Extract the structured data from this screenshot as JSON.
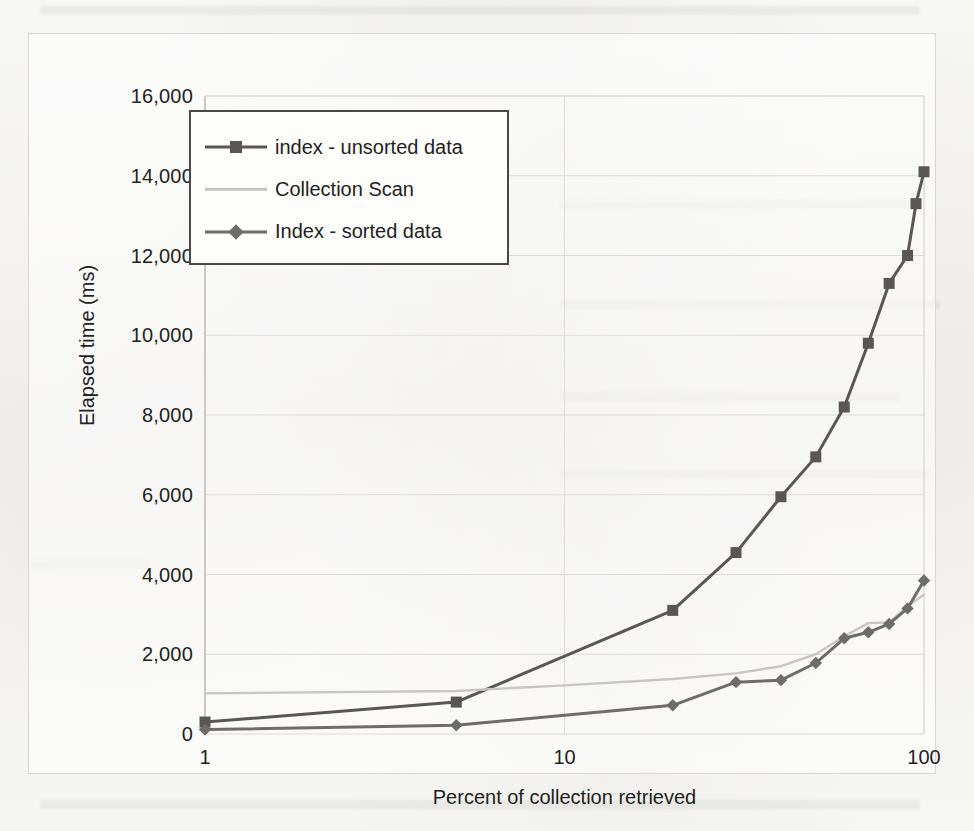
{
  "chart_data": {
    "type": "line",
    "title": "",
    "xlabel": "Percent of collection retrieved",
    "ylabel": "Elapsed time (ms)",
    "xscale": "log",
    "xlim": [
      1,
      100
    ],
    "ylim": [
      0,
      16000
    ],
    "xtick_labels": [
      "1",
      "10",
      "100"
    ],
    "xticks": [
      1,
      10,
      100
    ],
    "ytick_labels": [
      "0",
      "2,000",
      "4,000",
      "6,000",
      "8,000",
      "10,000",
      "12,000",
      "14,000",
      "16,000"
    ],
    "yticks": [
      0,
      2000,
      4000,
      6000,
      8000,
      10000,
      12000,
      14000,
      16000
    ],
    "grid": "horizontal-and-vertical",
    "legend_position": "upper-left-inside",
    "series": [
      {
        "name": "index - unsorted data",
        "color": "#595654",
        "marker": "square",
        "points": [
          [
            1,
            300
          ],
          [
            5,
            800
          ],
          [
            20,
            3100
          ],
          [
            30,
            4550
          ],
          [
            40,
            5950
          ],
          [
            50,
            6950
          ],
          [
            60,
            8200
          ],
          [
            70,
            9800
          ],
          [
            80,
            11300
          ],
          [
            90,
            12000
          ],
          [
            95,
            13300
          ],
          [
            100,
            14100
          ]
        ]
      },
      {
        "name": "Collection Scan",
        "color": "#c9c6c2",
        "marker": "none",
        "points": [
          [
            1,
            1020
          ],
          [
            5,
            1080
          ],
          [
            10,
            1220
          ],
          [
            20,
            1380
          ],
          [
            30,
            1520
          ],
          [
            40,
            1700
          ],
          [
            50,
            2000
          ],
          [
            60,
            2450
          ],
          [
            70,
            2780
          ],
          [
            80,
            2800
          ],
          [
            90,
            3200
          ],
          [
            100,
            3500
          ]
        ]
      },
      {
        "name": "Index - sorted data",
        "color": "#6e6b68",
        "marker": "diamond",
        "points": [
          [
            1,
            110
          ],
          [
            5,
            220
          ],
          [
            20,
            720
          ],
          [
            30,
            1300
          ],
          [
            40,
            1350
          ],
          [
            50,
            1780
          ],
          [
            60,
            2400
          ],
          [
            70,
            2550
          ],
          [
            80,
            2760
          ],
          [
            90,
            3150
          ],
          [
            100,
            3850
          ]
        ]
      }
    ]
  },
  "axes": {
    "y_title": "Elapsed time (ms)",
    "x_title": "Percent of  collection retrieved",
    "y_ticks": [
      "16,000",
      "14,000",
      "12,000",
      "10,000",
      "8,000",
      "6,000",
      "4,000",
      "2,000",
      "0"
    ],
    "x_ticks": [
      "1",
      "10",
      "100"
    ]
  },
  "legend": {
    "items": [
      {
        "label": "index - unsorted data",
        "color": "#595654",
        "marker": "square"
      },
      {
        "label": "Collection Scan",
        "color": "#c9c6c2",
        "marker": "none"
      },
      {
        "label": "Index - sorted data",
        "color": "#6e6b68",
        "marker": "diamond"
      }
    ]
  },
  "colors": {
    "unsorted": "#595654",
    "collection_scan": "#c9c6c2",
    "sorted": "#6e6b68",
    "grid": "#dedad6",
    "axis": "#bdb9b5",
    "text": "#231f1c",
    "page": "#fbfbfa"
  }
}
